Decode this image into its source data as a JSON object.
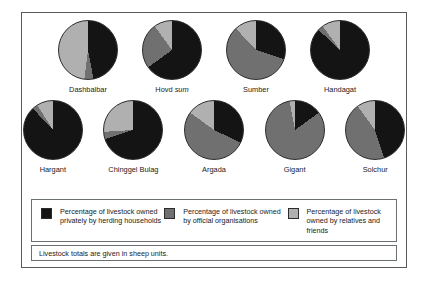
{
  "colors": {
    "private": "#141414",
    "official": "#707070",
    "relatives": "#b0b0b0",
    "frame": "#555b5e",
    "box": "#6a6f72",
    "background": "#ffffff"
  },
  "legend": {
    "items": [
      {
        "swatch_name": "legend-swatch-private",
        "label": "Percentage of livestock owned privately by herding households",
        "color": "#141414"
      },
      {
        "swatch_name": "legend-swatch-official",
        "label": "Percentage of livestock owned by official organisations",
        "color": "#707070"
      },
      {
        "swatch_name": "legend-swatch-relatives",
        "label": "Percentage of livestock owned by relatives and friends",
        "color": "#b0b0b0"
      }
    ]
  },
  "footnote": "Livestock totals are given in sheep units.",
  "chart_data": {
    "type": "pie",
    "title": "",
    "note": "Livestock totals are given in sheep units.",
    "series": [
      {
        "name": "Percentage of livestock owned privately by herding households",
        "color": "#141414"
      },
      {
        "name": "Percentage of livestock owned by official organisations",
        "color": "#707070"
      },
      {
        "name": "Percentage of livestock owned by relatives and friends",
        "color": "#b0b0b0"
      }
    ],
    "legend_position": "bottom",
    "rows": [
      {
        "pies": [
          {
            "label": "Dashbalbar",
            "label_italic_word": "",
            "values": [
              47,
              5,
              48
            ]
          },
          {
            "label": "Hovd sum",
            "label_italic_word": "sum",
            "values": [
              65,
              25,
              10
            ]
          },
          {
            "label": "Sumber",
            "label_italic_word": "",
            "values": [
              30,
              58,
              12
            ]
          },
          {
            "label": "Handagat",
            "label_italic_word": "",
            "values": [
              87,
              3,
              10
            ]
          }
        ]
      },
      {
        "pies": [
          {
            "label": "Hargant",
            "label_italic_word": "",
            "values": [
              88,
              3,
              9
            ]
          },
          {
            "label": "Chinggel Bulag",
            "label_italic_word": "",
            "values": [
              70,
              4,
              26
            ]
          },
          {
            "label": "Argada",
            "label_italic_word": "",
            "values": [
              32,
              53,
              15
            ]
          },
          {
            "label": "Gigant",
            "label_italic_word": "",
            "values": [
              15,
              82,
              3
            ]
          },
          {
            "label": "Solchur",
            "label_italic_word": "",
            "values": [
              45,
              45,
              10
            ]
          }
        ]
      }
    ]
  }
}
